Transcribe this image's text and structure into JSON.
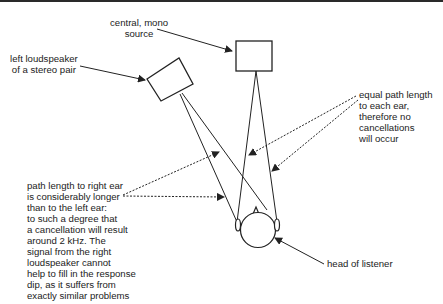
{
  "labels": {
    "central_source": "central, mono\nsource",
    "left_speaker": "left loudspeaker\nof a stereo pair",
    "equal_path": "equal path length\nto each ear,\ntherefore no\ncancellations\nwill occur",
    "longer_path": "path length to right ear\nis considerably longer\nthan to the left ear:\nto such a degree that\na cancellation will result\naround 2 kHz. The\nsignal from the right\nloudspeaker cannot\nhelp to fill in the response\ndip, as it suffers from\nexactly similar problems",
    "head": "head of listener"
  },
  "colors": {
    "line": "#222222",
    "background": "#ffffff"
  }
}
